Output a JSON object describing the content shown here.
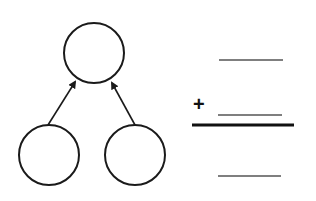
{
  "diagram": {
    "type": "number-bond",
    "circles": [
      {
        "id": "whole",
        "cx": 94,
        "cy": 53,
        "r": 30,
        "value": ""
      },
      {
        "id": "part-left",
        "cx": 49,
        "cy": 155,
        "r": 30,
        "value": ""
      },
      {
        "id": "part-right",
        "cx": 135,
        "cy": 155,
        "r": 30,
        "value": ""
      }
    ],
    "arrows": [
      {
        "from": "part-left",
        "to": "whole"
      },
      {
        "from": "part-right",
        "to": "whole"
      }
    ]
  },
  "addition": {
    "operator": "+",
    "addend_1": "",
    "addend_2": "",
    "sum": ""
  },
  "colors": {
    "stroke": "#1a1a1a",
    "blank_line": "#555555",
    "background": "#ffffff"
  }
}
